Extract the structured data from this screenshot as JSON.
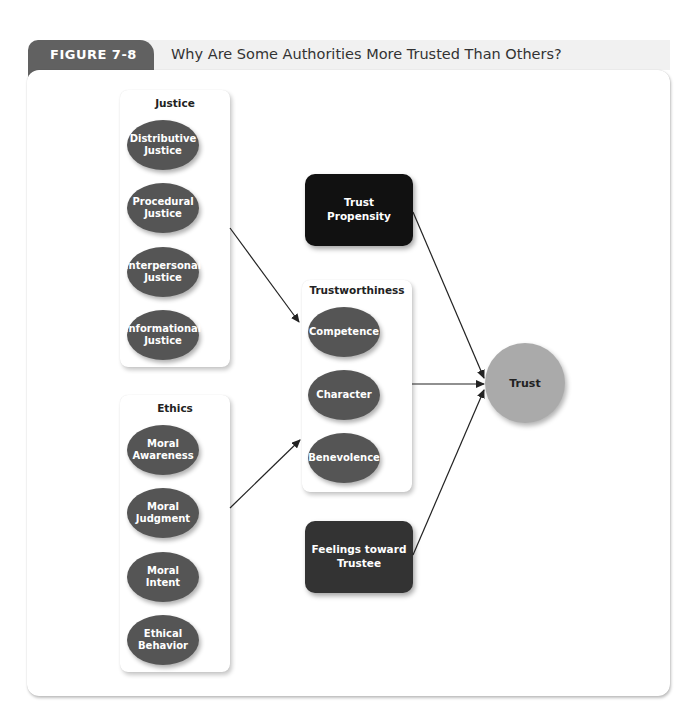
{
  "figure": {
    "label": "FIGURE 7-8",
    "title": "Why Are Some Authorities More Trusted Than Others?"
  },
  "justice": {
    "title": "Justice",
    "items": [
      "Distributive\nJustice",
      "Procedural\nJustice",
      "Interpersonal\nJustice",
      "Informational\nJustice"
    ]
  },
  "ethics": {
    "title": "Ethics",
    "items": [
      "Moral\nAwareness",
      "Moral\nJudgment",
      "Moral\nIntent",
      "Ethical\nBehavior"
    ]
  },
  "trustworthiness": {
    "title": "Trustworthiness",
    "items": [
      "Competence",
      "Character",
      "Benevolence"
    ]
  },
  "trust_propensity": "Trust\nPropensity",
  "feelings": "Feelings toward\nTrustee",
  "outcome": "Trust",
  "colors": {
    "tab": "#616161",
    "ellipse": "#555555",
    "propensity_box": "#111111",
    "feelings_box": "#333333",
    "trust_circle": "#aaaaaa"
  },
  "connections": [
    {
      "from": "Justice",
      "to": "Trustworthiness"
    },
    {
      "from": "Ethics",
      "to": "Trustworthiness"
    },
    {
      "from": "Trust Propensity",
      "to": "Trust"
    },
    {
      "from": "Trustworthiness",
      "to": "Trust"
    },
    {
      "from": "Feelings toward Trustee",
      "to": "Trust"
    }
  ]
}
